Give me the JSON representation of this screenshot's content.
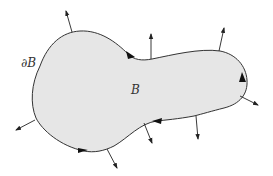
{
  "diagram": {
    "title": "",
    "labels": {
      "boundary": "∂B",
      "body": "B"
    },
    "colors": {
      "fill": "#e6e6e6",
      "stroke": "#333333",
      "arrow": "#222222",
      "background": "#ffffff"
    },
    "elements": {
      "region": "B (closed region, shaded)",
      "boundary_curve": "∂B (oriented boundary, counterclockwise direction markers)",
      "normal_vectors": 9,
      "direction_markers": 5
    }
  }
}
